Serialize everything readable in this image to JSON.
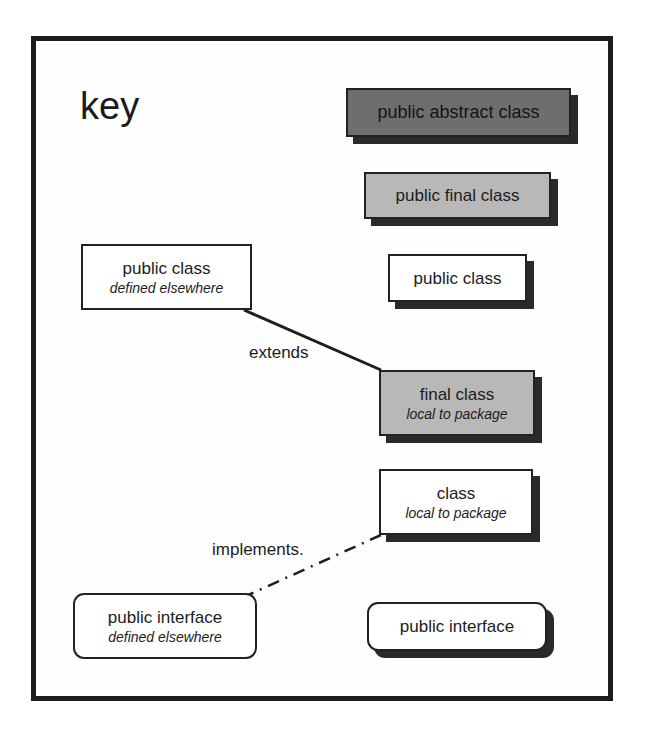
{
  "key": {
    "title": "key"
  },
  "legend": {
    "public_abstract_class": {
      "label": "public abstract class"
    },
    "public_final_class": {
      "label": "public final class"
    },
    "public_class": {
      "label": "public class"
    },
    "public_class_elsewhere": {
      "label": "public class",
      "sublabel": "defined elsewhere"
    },
    "final_class_local": {
      "label": "final class",
      "sublabel": "local to package"
    },
    "class_local": {
      "label": "class",
      "sublabel": "local to package"
    },
    "public_interface_elsewhere": {
      "label": "public interface",
      "sublabel": "defined elsewhere"
    },
    "public_interface": {
      "label": "public interface"
    }
  },
  "relations": {
    "extends": {
      "label": "extends",
      "style": "solid"
    },
    "implements": {
      "label": "implements.",
      "style": "dash-dot"
    }
  },
  "colors": {
    "abstract_fill": "#6e6e6e",
    "final_fill": "#b8b8b8",
    "plain_fill": "#ffffff",
    "border": "#222222",
    "shadow": "#2a2a2a"
  }
}
